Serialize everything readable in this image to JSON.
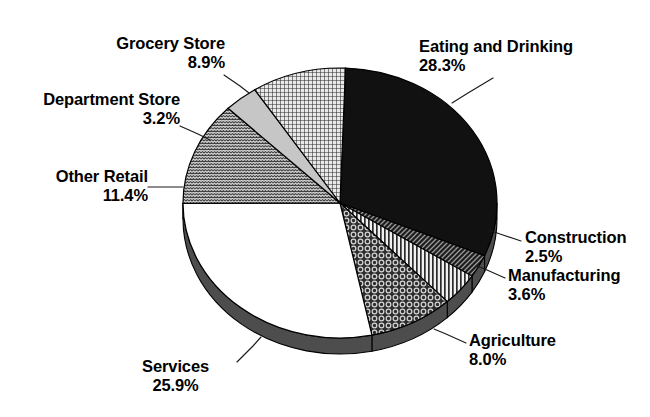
{
  "chart_data": {
    "type": "pie",
    "title": "",
    "subtitle": "",
    "xlabel": "",
    "ylabel": "",
    "legend_position": "callout-labels",
    "grid": false,
    "style": "3d-exploded-pie-grayscale",
    "value_unit": "percent",
    "total": 91.8,
    "categories": [
      "Eating and Drinking",
      "Construction",
      "Manufacturing",
      "Agriculture",
      "Services",
      "Other Retail",
      "Department Store",
      "Grocery Store"
    ],
    "values": [
      28.3,
      2.5,
      3.6,
      8.0,
      25.9,
      11.4,
      3.2,
      8.9
    ],
    "slices": [
      {
        "label": "Eating and Drinking",
        "percent_text": "28.3%",
        "value": 28.3,
        "fill": "#111111",
        "pattern": "solid-black",
        "label_side": "right",
        "label_x": 419,
        "label_y": 37,
        "leader": [
          [
            493,
            78
          ],
          [
            468,
            93
          ],
          [
            452,
            103
          ]
        ]
      },
      {
        "label": "Construction",
        "percent_text": "2.5%",
        "value": 2.5,
        "fill": "#3a3a3a",
        "pattern": "diagonal-hatch",
        "label_side": "right",
        "label_x": 525,
        "label_y": 228,
        "leader": [
          [
            521,
            241
          ],
          [
            500,
            234
          ],
          [
            489,
            230
          ]
        ]
      },
      {
        "label": "Manufacturing",
        "percent_text": "3.6%",
        "value": 3.6,
        "fill": "#d6d6d6",
        "pattern": "vertical-stripes",
        "label_side": "right",
        "label_x": 508,
        "label_y": 266,
        "leader": [
          [
            505,
            278
          ],
          [
            487,
            270
          ],
          [
            477,
            266
          ]
        ]
      },
      {
        "label": "Agriculture",
        "percent_text": "8.0%",
        "value": 8.0,
        "fill": "#4a4a4a",
        "pattern": "circles",
        "label_side": "right",
        "label_x": 469,
        "label_y": 331,
        "leader": [
          [
            466,
            343
          ],
          [
            446,
            334
          ],
          [
            434,
            329
          ]
        ]
      },
      {
        "label": "Services",
        "percent_text": "25.9%",
        "value": 25.9,
        "fill": "#ffffff",
        "pattern": "solid-white",
        "label_side": "center",
        "label_x": 186,
        "label_y": 361,
        "leader": [
          [
            237,
            362
          ],
          [
            253,
            346
          ],
          [
            261,
            337
          ]
        ]
      },
      {
        "label": "Other Retail",
        "percent_text": "11.4%",
        "value": 11.4,
        "fill": "#5a5a5a",
        "pattern": "zigzag-brick",
        "label_side": "left",
        "label_x": 33,
        "label_y": 167,
        "leader": [
          [
            148,
            187
          ],
          [
            168,
            187
          ],
          [
            183,
            187
          ]
        ]
      },
      {
        "label": "Department Store",
        "percent_text": "3.2%",
        "value": 3.2,
        "fill": "#c9c9c9",
        "pattern": "solid-lightgray",
        "label_side": "left",
        "label_x": 20,
        "label_y": 90,
        "leader": [
          [
            180,
            126
          ],
          [
            198,
            134
          ],
          [
            210,
            140
          ]
        ]
      },
      {
        "label": "Grocery Store",
        "percent_text": "8.9%",
        "value": 8.9,
        "fill": "#b8b8b8",
        "pattern": "fine-crosshatch",
        "label_side": "center",
        "label_x": 113,
        "label_y": 34,
        "leader": [
          [
            224,
            75
          ],
          [
            240,
            86
          ],
          [
            249,
            93
          ]
        ]
      }
    ],
    "geometry": {
      "center_x": 340,
      "center_y": 203,
      "radius_x": 157,
      "radius_y": 135,
      "depth": 16,
      "start_angle_deg": -88
    },
    "colors": {
      "text": "#000000",
      "outline": "#000000",
      "background": "#ffffff",
      "rim": "#4d4d4d"
    }
  }
}
